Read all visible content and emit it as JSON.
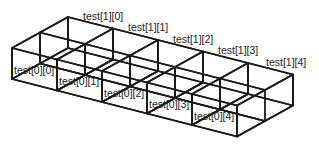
{
  "diagram": {
    "title": "",
    "rows": 2,
    "cols": 5,
    "colors": {
      "front_face": "#ffffff",
      "inner_back_wall": "#c8c8c8",
      "inner_side_wall": "#b0b0b0",
      "floor": "#dcdcdc",
      "right_side": "#8e8e8e",
      "edge": "#1a1a1a"
    },
    "geometry": {
      "origin_front_top_left": [
        12,
        48
      ],
      "col_step": [
        45,
        11.5
      ],
      "row_step": [
        28,
        -15.5
      ],
      "height": 31
    },
    "front_labels": [
      "test[0][0]",
      "test[0][1]",
      "test[0][2]",
      "test[0][3]",
      "test[0][4]"
    ],
    "back_labels": [
      "test[1][0]",
      "test[1][1]",
      "test[1][2]",
      "test[1][3]",
      "test[1][4]"
    ],
    "back_label_positions": [
      [
        83,
        20
      ],
      [
        128,
        31
      ],
      [
        173,
        43
      ],
      [
        218,
        54
      ],
      [
        266,
        66
      ]
    ],
    "front_label_positions": [
      [
        14,
        74
      ],
      [
        59,
        85
      ],
      [
        104,
        97
      ],
      [
        149,
        108
      ],
      [
        194,
        120
      ]
    ]
  }
}
